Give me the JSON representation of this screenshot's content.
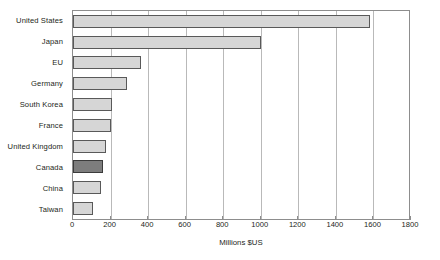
{
  "chart_data": {
    "type": "bar",
    "orientation": "horizontal",
    "title": "",
    "subtitle": "",
    "xlabel": "Millions $US",
    "ylabel": "",
    "xlim": [
      0,
      1800
    ],
    "xticks": [
      0,
      200,
      400,
      600,
      800,
      1000,
      1200,
      1400,
      1600,
      1800
    ],
    "xtick_labels": [
      "0",
      "200",
      "400",
      "600",
      "800",
      "1000",
      "1200",
      "1400",
      "1600",
      "1800"
    ],
    "grid": "vertical",
    "legend": "none",
    "categories": [
      "United States",
      "Japan",
      "EU",
      "Germany",
      "South Korea",
      "France",
      "United Kingdom",
      "Canada",
      "China",
      "Taiwan"
    ],
    "values": [
      1580,
      1000,
      360,
      285,
      210,
      200,
      175,
      160,
      150,
      105
    ],
    "highlighted_category": "Canada",
    "colors": {
      "bar_fill": "#d6d6d6",
      "bar_stroke": "#595959",
      "highlight_fill": "#7d7d7d",
      "highlight_stroke": "#3b3b3b",
      "gridline": "#b9b9b9",
      "frame": "#8d8d8d",
      "text": "#231f20",
      "background": "#ffffff"
    }
  }
}
